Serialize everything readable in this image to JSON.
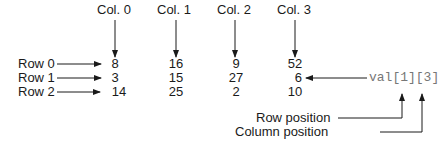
{
  "columns": [
    "Col. 0",
    "Col. 1",
    "Col. 2",
    "Col. 3"
  ],
  "rows": [
    "Row 0",
    "Row 1",
    "Row 2"
  ],
  "values": [
    [
      "8",
      "16",
      "9",
      "52"
    ],
    [
      "3",
      "15",
      "27",
      "6"
    ],
    [
      "14",
      "25",
      "2",
      "10"
    ]
  ],
  "expression": "val[1][3]",
  "annotations": {
    "row_position": "Row position",
    "column_position": "Column position"
  },
  "colors": {
    "text": "#1a1a1a",
    "code": "#777777",
    "arrow": "#1a1a1a"
  }
}
